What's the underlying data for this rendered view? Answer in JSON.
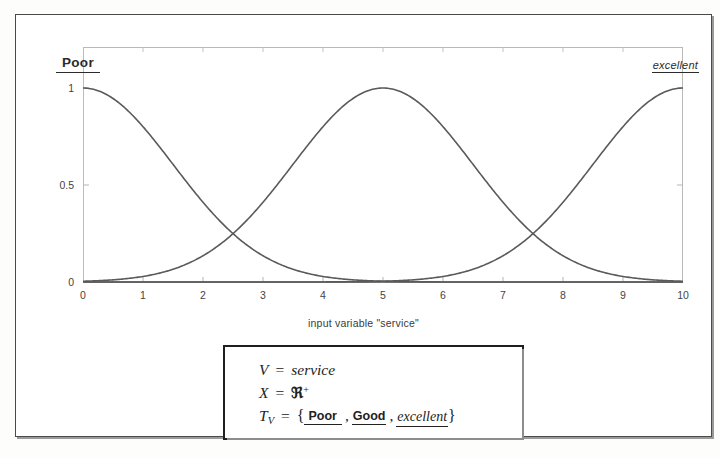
{
  "figure": {
    "plot": {
      "label_left": "Poor",
      "label_right": "excellent",
      "xaxis_title": "input variable \"service\"",
      "y_ticks": [
        "1",
        "0.5",
        "0"
      ],
      "x_ticks": [
        "0",
        "1",
        "2",
        "3",
        "4",
        "5",
        "6",
        "7",
        "8",
        "9",
        "10"
      ]
    },
    "formula": {
      "line1_var": "V",
      "line1_eq": "=",
      "line1_val": "service",
      "line2_var": "X",
      "line2_eq": "=",
      "line2_val": "ℜ",
      "line2_sup": "+",
      "line3_var": "T",
      "line3_sub": "V",
      "line3_eq": "=",
      "line3_open": "{",
      "term_poor": "Poor",
      "term_good": "Good",
      "term_excellent": "excellent",
      "line3_close": "}",
      "comma": ","
    }
  },
  "colors": {
    "curve": "#555555",
    "frame": "#4a4a4a",
    "plot_border": "#b9b9b9",
    "text": "#2b2b2b"
  },
  "chart_data": {
    "type": "line",
    "title": "",
    "xlabel": "input variable \"service\"",
    "ylabel": "",
    "xlim": [
      0,
      10
    ],
    "ylim": [
      0,
      1
    ],
    "grid": false,
    "legend_position": "on-plot",
    "x": [
      0,
      0.25,
      0.5,
      0.75,
      1,
      1.25,
      1.5,
      1.75,
      2,
      2.25,
      2.5,
      2.75,
      3,
      3.25,
      3.5,
      3.75,
      4,
      4.25,
      4.5,
      4.75,
      5,
      5.25,
      5.5,
      5.75,
      6,
      6.25,
      6.5,
      6.75,
      7,
      7.25,
      7.5,
      7.75,
      8,
      8.25,
      8.5,
      8.75,
      9,
      9.25,
      9.5,
      9.75,
      10
    ],
    "series": [
      {
        "name": "Poor",
        "type": "gaussian",
        "mean": 0,
        "sigma": 1.5,
        "values": [
          1,
          0.986,
          0.946,
          0.882,
          0.801,
          0.707,
          0.607,
          0.507,
          0.411,
          0.324,
          0.249,
          0.185,
          0.135,
          0.095,
          0.066,
          0.044,
          0.029,
          0.018,
          0.011,
          0.0065,
          0.0038,
          0.0021,
          0.0011,
          0.00059,
          0.0003,
          0.00014,
          7e-05,
          3e-05,
          1e-05,
          5e-06,
          2e-06,
          1e-06,
          0,
          0,
          0,
          0,
          0,
          0,
          0,
          0,
          0
        ]
      },
      {
        "name": "Good",
        "type": "gaussian",
        "mean": 5,
        "sigma": 1.5,
        "values": [
          0.0038,
          0.0065,
          0.011,
          0.018,
          0.029,
          0.044,
          0.066,
          0.095,
          0.135,
          0.185,
          0.249,
          0.324,
          0.411,
          0.507,
          0.607,
          0.707,
          0.801,
          0.882,
          0.946,
          0.986,
          1,
          0.986,
          0.946,
          0.882,
          0.801,
          0.707,
          0.607,
          0.507,
          0.411,
          0.324,
          0.249,
          0.185,
          0.135,
          0.095,
          0.066,
          0.044,
          0.029,
          0.018,
          0.011,
          0.0065,
          0.0038
        ]
      },
      {
        "name": "excellent",
        "type": "gaussian",
        "mean": 10,
        "sigma": 1.5,
        "values": [
          0,
          0,
          0,
          0,
          0,
          0,
          0,
          0,
          1e-06,
          2e-06,
          5e-06,
          1e-05,
          3e-05,
          7e-05,
          0.00014,
          0.0003,
          0.00059,
          0.0011,
          0.0021,
          0.0038,
          0.0065,
          0.011,
          0.018,
          0.029,
          0.044,
          0.066,
          0.095,
          0.135,
          0.185,
          0.249,
          0.324,
          0.411,
          0.507,
          0.607,
          0.707,
          0.801,
          0.882,
          0.946,
          0.986,
          1,
          1
        ]
      }
    ],
    "annotations": [
      {
        "text": "Poor",
        "x": 0.1,
        "y": 1.08
      },
      {
        "text": "excellent",
        "x": 9.9,
        "y": 1.06
      }
    ]
  }
}
